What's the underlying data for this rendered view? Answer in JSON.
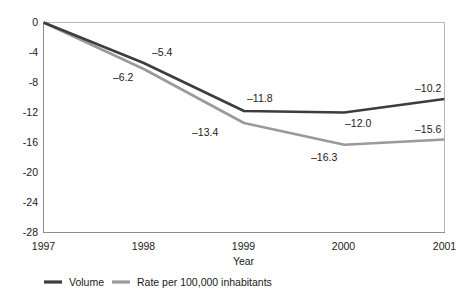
{
  "chart_data": {
    "type": "line",
    "title": "",
    "subtitle": "",
    "xlabel": "Year",
    "ylabel": "",
    "x": [
      "1997",
      "1998",
      "1999",
      "2000",
      "2001"
    ],
    "categories": [
      "1997",
      "1998",
      "1999",
      "2000",
      "2001"
    ],
    "ylim": [
      -28,
      0
    ],
    "yticks": [
      "0",
      "-4",
      "-8",
      "-12",
      "-16",
      "-20",
      "-24",
      "-28"
    ],
    "ytick_values": [
      0,
      -4,
      -8,
      -12,
      -16,
      -20,
      -24,
      -28
    ],
    "grid": false,
    "legend_position": "bottom-left",
    "series": [
      {
        "name": "Volume",
        "color": "#3d3d3d",
        "values": [
          0,
          -5.4,
          -11.8,
          -12.0,
          -10.2
        ],
        "labels": [
          "",
          "–5.4",
          "–11.8",
          "–12.0",
          "–10.2"
        ]
      },
      {
        "name": "Rate per 100,000 inhabitants",
        "color": "#9a9a9a",
        "values": [
          0,
          -6.2,
          -13.4,
          -16.3,
          -15.6
        ],
        "labels": [
          "",
          "–6.2",
          "–13.4",
          "–16.3",
          "–15.6"
        ]
      }
    ]
  },
  "axes": {
    "x_tick_labels": [
      "1997",
      "1998",
      "1999",
      "2000",
      "2001"
    ],
    "y_tick_labels": [
      "0",
      "-4",
      "-8",
      "-12",
      "-16",
      "-20",
      "-24",
      "-28"
    ],
    "x_axis_title": "Year"
  },
  "labels": {
    "volume": {
      "y1998": "–5.4",
      "y1999": "–11.8",
      "y2000": "–12.0",
      "y2001": "–10.2"
    },
    "rate": {
      "y1998": "–6.2",
      "y1999": "–13.4",
      "y2000": "–16.3",
      "y2001": "–15.6"
    }
  },
  "legend": {
    "items": [
      {
        "label": "Volume",
        "color": "#3d3d3d"
      },
      {
        "label": "Rate per 100,000 inhabitants",
        "color": "#9a9a9a"
      }
    ]
  },
  "colors": {
    "volume_line": "#3d3d3d",
    "rate_line": "#9a9a9a",
    "frame": "#b8b8b8",
    "text": "#1a1a1a"
  }
}
